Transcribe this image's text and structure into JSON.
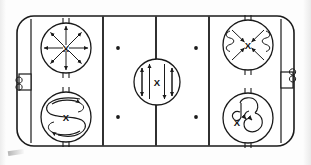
{
  "diagram": {
    "type": "hockey-rink-drill",
    "stroke_color": "#1a1a1a",
    "ice_color": "#ffffff",
    "rink": {
      "x": 17,
      "y": 16,
      "width": 277,
      "height": 130,
      "corner_radius": 17,
      "border_width": 1.6
    },
    "lines": [
      {
        "name": "left-goal-line",
        "x": 31,
        "label": "Goal Line",
        "width": 1.2
      },
      {
        "name": "left-blue-line",
        "x": 103,
        "label": "Blue Line",
        "width": 1.8
      },
      {
        "name": "center-red-line",
        "x": 156,
        "label": "Center Line",
        "width": 1.8
      },
      {
        "name": "right-blue-line",
        "x": 209,
        "label": "Blue Line",
        "width": 1.8
      },
      {
        "name": "right-goal-line",
        "x": 281,
        "label": "Goal Line",
        "width": 1.2
      }
    ],
    "goals": [
      {
        "name": "left-goal",
        "x": 18,
        "y": 74,
        "width": 13,
        "height": 17
      },
      {
        "name": "right-goal",
        "x": 281,
        "y": 72,
        "width": 13,
        "height": 17
      }
    ],
    "neutral_dots": [
      {
        "name": "neutral-dot-top-left",
        "cx": 118,
        "cy": 48
      },
      {
        "name": "neutral-dot-top-right",
        "cx": 196,
        "cy": 48
      },
      {
        "name": "neutral-dot-bottom-left",
        "cx": 118,
        "cy": 117
      },
      {
        "name": "neutral-dot-bottom-right",
        "cx": 196,
        "cy": 117
      }
    ],
    "circles": [
      {
        "name": "faceoff-circle-top-left",
        "cx": 66,
        "cy": 48,
        "r": 25,
        "drill": "radial-starburst",
        "drill_label": "Eight-direction radial starts from center",
        "center_mark": "X",
        "arrows": 8
      },
      {
        "name": "faceoff-circle-bottom-left",
        "cx": 66,
        "cy": 117,
        "r": 25,
        "drill": "s-weave-loop",
        "drill_label": "S-weave figure-eight loop",
        "center_mark": "X",
        "arrows": 2
      },
      {
        "name": "faceoff-circle-center",
        "cx": 157,
        "cy": 82,
        "r": 23,
        "drill": "vertical-up-down-lanes",
        "drill_label": "Four vertical lanes, two up two down",
        "center_mark": "X",
        "arrows": 4
      },
      {
        "name": "faceoff-circle-top-right",
        "cx": 248,
        "cy": 45,
        "r": 25,
        "drill": "diagonal-cross-with-edge-weaves",
        "drill_label": "Diagonal cross-in with side weave squiggles",
        "center_mark": "X",
        "arrows": 4
      },
      {
        "name": "faceoff-circle-bottom-right",
        "cx": 248,
        "cy": 118,
        "r": 25,
        "drill": "double-curl-loops",
        "drill_label": "Double curl loop-back pattern",
        "center_mark": "X",
        "arrows": 2
      }
    ],
    "hash_marks_note": "Short hash marks above and below each faceoff circle"
  }
}
